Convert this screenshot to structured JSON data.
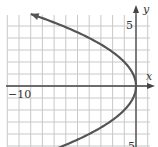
{
  "chart_data": {
    "type": "line",
    "title": "",
    "xlabel": "x",
    "ylabel": "y",
    "equation": "x = -y^2/4",
    "xlim": [
      -10.5,
      1.5
    ],
    "ylim": [
      -5,
      6
    ],
    "grid": true,
    "tick_labels": {
      "x": [
        "-10"
      ],
      "y": [
        "5",
        "-5"
      ]
    },
    "series": [
      {
        "name": "parabola",
        "color": "#555555",
        "arrow_end": "top-left",
        "points": [
          [
            -9,
            6
          ],
          [
            -6.25,
            5
          ],
          [
            -4,
            4
          ],
          [
            -2.25,
            3
          ],
          [
            -1,
            2
          ],
          [
            -0.25,
            1
          ],
          [
            0,
            0
          ],
          [
            -0.25,
            -1
          ],
          [
            -1,
            -2
          ],
          [
            -2.25,
            -3
          ],
          [
            -4,
            -4
          ],
          [
            -6.25,
            -5
          ]
        ]
      }
    ]
  },
  "labels": {
    "x_axis": "x",
    "y_axis": "y",
    "x_tick_min": "−10",
    "y_tick_top": "5",
    "y_tick_bottom": "5"
  },
  "colors": {
    "grid": "#c8c8c8",
    "axis": "#444444",
    "curve": "#555555"
  }
}
